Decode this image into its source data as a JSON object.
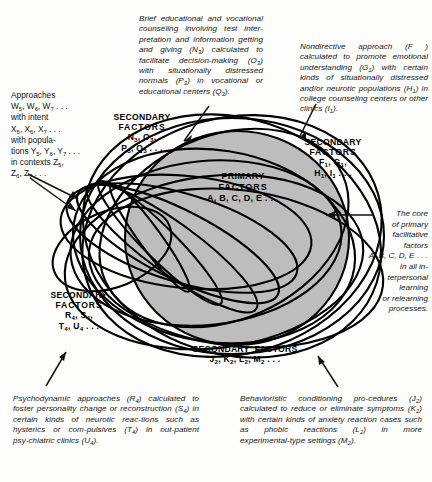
{
  "figure": {
    "type": "venn-overlapping-ellipses",
    "core_fill": "#bdbdbd",
    "stroke": "#000000",
    "background": "#fdfdfb"
  },
  "center_label": {
    "line1": "PRIMARY",
    "line2": "FACTORS",
    "line3": "A, B, C, D, E . . ."
  },
  "groups": {
    "top_left": {
      "line1": "SECONDARY",
      "line2": "FACTORS",
      "line3": "N3, O3,",
      "line4": "P3, Q3 . . ."
    },
    "top_right": {
      "line1": "SECONDARY",
      "line2": "FACTORS",
      "line3": "F1, G1,",
      "line4": "H1, I1 . . ."
    },
    "bottom_left": {
      "line1": "SECONDARY",
      "line2": "FACTORS",
      "line3": "R4, S4,",
      "line4": "T4, U4 . . ."
    },
    "bottom_center": {
      "line1": "SECONDARY  FACTORS",
      "line2": "J2, K2, L2, M2 . . ."
    }
  },
  "approaches_block": {
    "l1": "Approaches",
    "l2": "W5, W6, W7 . . .",
    "l3": "with intent",
    "l4": "X5, X6, X7 . . .",
    "l5": "with popula-",
    "l6": "tions Y5, Y6, Y7 . . .",
    "l7": "in contexts Z5,",
    "l8": "Z6, Z7 . . ."
  },
  "captions": {
    "top_center": "Brief educational and vocational counseling involving test interpretation and information getting and giving (N3) calculated to facilitate decision-making (O3) with situationally distressed normals (P3) in vocational or educational centers (Q3).",
    "top_right": "Nondirective approach (F ) calculated to promote emotional understanding (G1) with certain kinds of situationally distressed and/or neurotic populations (H1) in college counseling centers or other clinics (I1).",
    "bottom_left": "Psychodynamic approaches (R4) calculated to foster personality change or reconstruction (S4) in certain kinds of neurotic reactions such as hysterics or compulsives (T4) in out-patient psychiatric clinics (U4).",
    "bottom_right": "Behavioristic conditioning procedures (J2) calculated to reduce or eliminate symptoms (K2) with certain kinds of anxiety reaction cases such as phobic reactions (L2) in more experimental-type settings (M2)."
  },
  "core_note": {
    "l1": "The core",
    "l2": "of primary",
    "l3": "facilitative",
    "l4": "factors",
    "l5": "A, B, C, D, E . . .",
    "l6": "in all in-",
    "l7": "terpersonal",
    "l8": "learning",
    "l9": "or relearning",
    "l10": "processes."
  }
}
